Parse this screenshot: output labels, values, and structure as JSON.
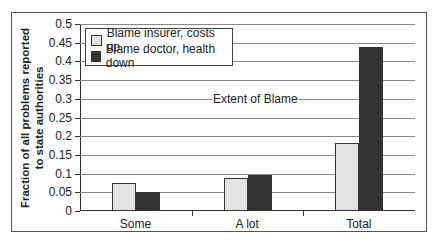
{
  "chart_data": {
    "type": "bar",
    "title": "",
    "annotation": "Extent of Blame",
    "xlabel": "",
    "ylabel": "Fraction of all problems reported to state authorities",
    "ylabel_lines": [
      "Fraction of all problems reported",
      "to state authorities"
    ],
    "ylim": [
      0,
      0.5
    ],
    "yticks": [
      "0",
      "0.05",
      "0.1",
      "0.15",
      "0.2",
      "0.25",
      "0.3",
      "0.35",
      "0.4",
      "0.45",
      "0.5"
    ],
    "grid": true,
    "legend_position": "top-left inside",
    "categories": [
      "Some",
      "A lot",
      "Total"
    ],
    "series": [
      {
        "name": "Blame insurer, costs up",
        "color": "#e2e2e2",
        "values": [
          0.075,
          0.088,
          0.182
        ]
      },
      {
        "name": "Blame doctor, health down",
        "color": "#333333",
        "values": [
          0.05,
          0.095,
          0.438
        ]
      }
    ]
  }
}
